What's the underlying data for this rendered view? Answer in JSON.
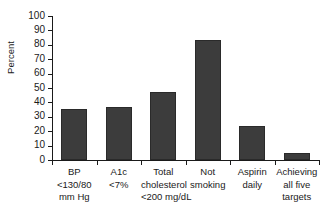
{
  "chart_data": {
    "type": "bar",
    "title": "",
    "xlabel": "",
    "ylabel": "Percent",
    "ylim": [
      0,
      100
    ],
    "yticks": [
      0,
      10,
      20,
      30,
      40,
      50,
      60,
      70,
      80,
      90,
      100
    ],
    "grid": false,
    "legend": null,
    "bar_color": "#3c3c3c",
    "bar_edge_color": "#2a2a2a",
    "axis_color": "#1a1a1a",
    "categories": [
      "BP <130/80 mm Hg",
      "A1c <7%",
      "Total cholesterol <200 mg/dL",
      "Not smoking",
      "Aspirin daily",
      "Achieving all five targets"
    ],
    "category_lines": [
      [
        "BP",
        "<130/80",
        "mm Hg"
      ],
      [
        "A1c",
        "<7%"
      ],
      [
        "Total",
        "cholesterol",
        "<200 mg/dL"
      ],
      [
        "Not",
        "smoking"
      ],
      [
        "Aspirin",
        "daily"
      ],
      [
        "Achieving",
        "all five",
        "targets"
      ]
    ],
    "values": [
      35.5,
      37,
      47.5,
      83,
      23.5,
      5
    ]
  }
}
